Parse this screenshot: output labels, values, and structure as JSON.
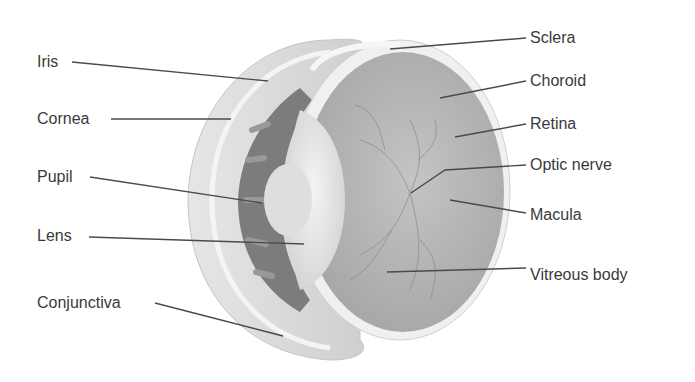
{
  "diagram": {
    "labels_left": [
      {
        "id": "iris",
        "text": "Iris",
        "x": 37,
        "y": 53
      },
      {
        "id": "cornea",
        "text": "Cornea",
        "x": 37,
        "y": 110
      },
      {
        "id": "pupil",
        "text": "Pupil",
        "x": 37,
        "y": 168
      },
      {
        "id": "lens",
        "text": "Lens",
        "x": 37,
        "y": 227
      },
      {
        "id": "conjunctiva",
        "text": "Conjunctiva",
        "x": 37,
        "y": 294
      }
    ],
    "labels_right": [
      {
        "id": "sclera",
        "text": "Sclera",
        "x": 530,
        "y": 29
      },
      {
        "id": "choroid",
        "text": "Choroid",
        "x": 530,
        "y": 72
      },
      {
        "id": "retina",
        "text": "Retina",
        "x": 530,
        "y": 115
      },
      {
        "id": "optic-nerve",
        "text": "Optic nerve",
        "x": 530,
        "y": 156
      },
      {
        "id": "macula",
        "text": "Macula",
        "x": 530,
        "y": 206
      },
      {
        "id": "vitreous-body",
        "text": "Vitreous body",
        "x": 530,
        "y": 266
      }
    ],
    "colors": {
      "label_text": "#3a3a3a",
      "leader_line": "#4a4a4a",
      "outer_shell": "#d6d6d6",
      "sclera_white": "#f2f2f2",
      "vitreous": "#b4b4b4",
      "iris_dark": "#7a7a7a",
      "lens": "#e6e6e6"
    }
  }
}
